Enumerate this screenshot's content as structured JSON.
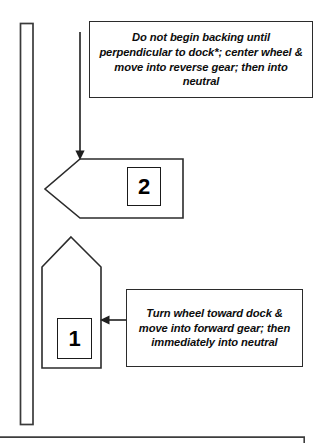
{
  "diagram": {
    "stroke_color": "#2b2b2b",
    "background_color": "#ffffff",
    "dock": {
      "name": "dock",
      "label": ""
    },
    "vessels": [
      {
        "id": "vessel-2",
        "number": "2",
        "orientation": "pointing-left"
      },
      {
        "id": "vessel-1",
        "number": "1",
        "orientation": "pointing-up"
      }
    ],
    "callouts": [
      {
        "id": "callout-top",
        "text": "Do not begin backing until perpendicular to dock*; center wheel & move into reverse gear; then into neutral"
      },
      {
        "id": "callout-bottom",
        "text": "Turn wheel  toward dock & move into forward gear; then immediately into neutral"
      }
    ],
    "arrows": [
      {
        "id": "arrow-down-to-vessel-2",
        "direction": "down"
      },
      {
        "id": "arrow-left-to-vessel-1",
        "direction": "left"
      }
    ]
  }
}
